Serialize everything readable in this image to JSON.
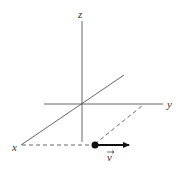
{
  "diagram": {
    "type": "3d-coordinate-axes",
    "axes": {
      "z": {
        "label": "z"
      },
      "y": {
        "label": "y"
      },
      "x": {
        "label": "x"
      }
    },
    "vector": {
      "label": "v",
      "has_arrow_accent": true,
      "color": "#111111"
    },
    "colors": {
      "axis": "#555555",
      "background": "#ffffff"
    }
  }
}
